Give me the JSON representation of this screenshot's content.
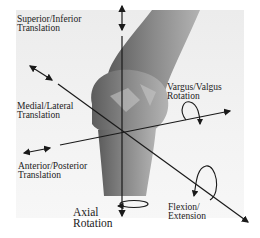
{
  "diagram": {
    "labels": {
      "superior_inferior": [
        "Superior/Inferior",
        "Translation"
      ],
      "medial_lateral": [
        "Medial/Lateral",
        "Translation"
      ],
      "anterior_posterior": [
        "Anterior/Posterior",
        "Translation"
      ],
      "vargus_valgus": [
        "Vargus/Valgus",
        "Rotation"
      ],
      "flexion_extension": [
        "Flexion/",
        "Extension"
      ],
      "axial": [
        "Axial",
        "Rotation"
      ]
    },
    "colors": {
      "background": "#efefef",
      "bone_dark": "#6e6e6e",
      "bone_light": "#a8a8a8",
      "axis": "#1a1a1a"
    }
  }
}
